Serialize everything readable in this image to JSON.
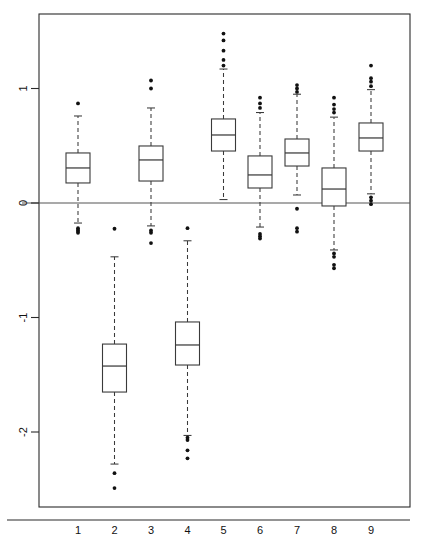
{
  "chart_data": {
    "type": "box",
    "title": "",
    "xlabel": "",
    "ylabel": "",
    "categories": [
      "1",
      "2",
      "3",
      "4",
      "5",
      "6",
      "7",
      "8",
      "9"
    ],
    "xtick_labels": [
      "1",
      "2",
      "3",
      "4",
      "5",
      "6",
      "7",
      "8",
      "9"
    ],
    "ytick_labels": [
      "1",
      "0",
      "-1",
      "-2"
    ],
    "ytick_values": [
      1,
      0,
      -1,
      -2
    ],
    "ylim": [
      -2.55,
      1.65
    ],
    "xlim": [
      0.4,
      9.6
    ],
    "grid": false,
    "legend": null,
    "reference_lines": [
      {
        "orientation": "horizontal",
        "value": 0,
        "color": "#555555"
      }
    ],
    "colors": {
      "box_fill": "#ffffff",
      "box_edge": "#3a3a3a",
      "median": "#3a3a3a",
      "whisker": "#3a3a3a",
      "outlier": "#111111",
      "axis": "#2b2b2b",
      "zero_line": "#555555",
      "background": "#ffffff"
    },
    "boxes": [
      {
        "label": "1",
        "position": 1,
        "q1": 0.175,
        "median": 0.306,
        "q3": 0.437,
        "whisker_low": -0.175,
        "whisker_high": 0.76,
        "outliers_high": [
          0.87
        ],
        "outliers_low": [
          -0.22,
          -0.235,
          -0.245,
          -0.26
        ]
      },
      {
        "label": "2",
        "position": 2,
        "q1": -1.651,
        "median": -1.424,
        "q3": -1.232,
        "whisker_low": -2.28,
        "whisker_high": -0.47,
        "outliers_high": [
          -0.225
        ],
        "outliers_low": [
          -2.36,
          -2.49
        ]
      },
      {
        "label": "3",
        "position": 3,
        "q1": 0.192,
        "median": 0.376,
        "q3": 0.498,
        "whisker_low": -0.2,
        "whisker_high": 0.83,
        "outliers_high": [
          1.0,
          1.07
        ],
        "outliers_low": [
          -0.24,
          -0.26,
          -0.35
        ]
      },
      {
        "label": "4",
        "position": 4,
        "q1": -1.415,
        "median": -1.24,
        "q3": -1.039,
        "whisker_low": -2.03,
        "whisker_high": -0.33,
        "outliers_high": [
          -0.22
        ],
        "outliers_low": [
          -2.05,
          -2.07,
          -2.16,
          -2.23
        ]
      },
      {
        "label": "5",
        "position": 5,
        "q1": 0.454,
        "median": 0.594,
        "q3": 0.734,
        "whisker_low": 0.03,
        "whisker_high": 1.17,
        "outliers_high": [
          1.2,
          1.25,
          1.33,
          1.42,
          1.48
        ],
        "outliers_low": []
      },
      {
        "label": "6",
        "position": 6,
        "q1": 0.131,
        "median": 0.245,
        "q3": 0.411,
        "whisker_low": -0.21,
        "whisker_high": 0.79,
        "outliers_high": [
          0.83,
          0.87,
          0.92
        ],
        "outliers_low": [
          -0.27,
          -0.29,
          -0.31
        ]
      },
      {
        "label": "7",
        "position": 7,
        "q1": 0.323,
        "median": 0.437,
        "q3": 0.559,
        "whisker_low": 0.07,
        "whisker_high": 0.95,
        "outliers_high": [
          0.97,
          1.0,
          1.03
        ],
        "outliers_low": [
          -0.05,
          -0.22,
          -0.25
        ]
      },
      {
        "label": "8",
        "position": 8,
        "q1": -0.026,
        "median": 0.122,
        "q3": 0.306,
        "whisker_low": -0.41,
        "whisker_high": 0.75,
        "outliers_high": [
          0.79,
          0.82,
          0.86,
          0.92
        ],
        "outliers_low": [
          -0.44,
          -0.47,
          -0.54,
          -0.57
        ]
      },
      {
        "label": "9",
        "position": 9,
        "q1": 0.454,
        "median": 0.568,
        "q3": 0.699,
        "whisker_low": 0.08,
        "whisker_high": 0.99,
        "outliers_high": [
          1.02,
          1.06,
          1.09,
          1.2
        ],
        "outliers_low": [
          0.05,
          0.02,
          -0.01
        ]
      }
    ]
  }
}
